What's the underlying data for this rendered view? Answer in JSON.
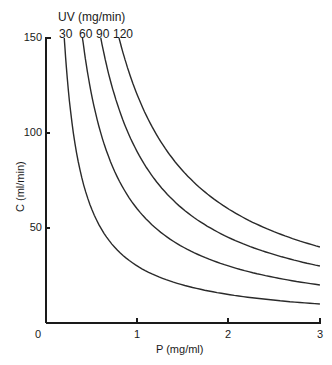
{
  "chart_data": {
    "type": "line",
    "title": "",
    "xlabel": "P (mg/ml)",
    "ylabel": "C (ml/min)",
    "legend_title": "UV (mg/min)",
    "xlim": [
      0,
      3
    ],
    "ylim": [
      0,
      150
    ],
    "x_ticks": [
      "0",
      "1",
      "2",
      "3"
    ],
    "y_ticks": [
      "50",
      "100",
      "150"
    ],
    "grid": false,
    "relation": "C = UV / P",
    "series": [
      {
        "name": "30",
        "uv": 30,
        "x": [
          0.2,
          0.25,
          0.3,
          0.4,
          0.5,
          0.75,
          1.0,
          1.5,
          2.0,
          2.5,
          3.0
        ],
        "values": [
          150,
          120,
          100,
          75,
          60,
          40,
          30,
          20,
          15,
          12,
          10
        ]
      },
      {
        "name": "60",
        "uv": 60,
        "x": [
          0.4,
          0.5,
          0.6,
          0.75,
          1.0,
          1.25,
          1.5,
          2.0,
          2.5,
          3.0
        ],
        "values": [
          150,
          120,
          100,
          80,
          60,
          48,
          40,
          30,
          24,
          20
        ]
      },
      {
        "name": "90",
        "uv": 90,
        "x": [
          0.6,
          0.75,
          0.9,
          1.0,
          1.25,
          1.5,
          2.0,
          2.5,
          3.0
        ],
        "values": [
          150,
          120,
          100,
          90,
          72,
          60,
          45,
          36,
          30
        ]
      },
      {
        "name": "120",
        "uv": 120,
        "x": [
          0.8,
          1.0,
          1.2,
          1.5,
          2.0,
          2.5,
          3.0
        ],
        "values": [
          150,
          120,
          100,
          80,
          60,
          48,
          40
        ]
      }
    ]
  },
  "labels": {
    "legend_title": "UV (mg/min)",
    "curve_labels": [
      "30",
      "60",
      "90",
      "120"
    ],
    "xlabel": "P (mg/ml)",
    "ylabel": "C (ml/min)",
    "origin": "0",
    "x1": "1",
    "x2": "2",
    "x3": "3",
    "y50": "50",
    "y100": "100",
    "y150": "150"
  },
  "colors": {
    "line": "#2a2a2a",
    "axis": "#1a1a1a",
    "background": "#ffffff"
  }
}
